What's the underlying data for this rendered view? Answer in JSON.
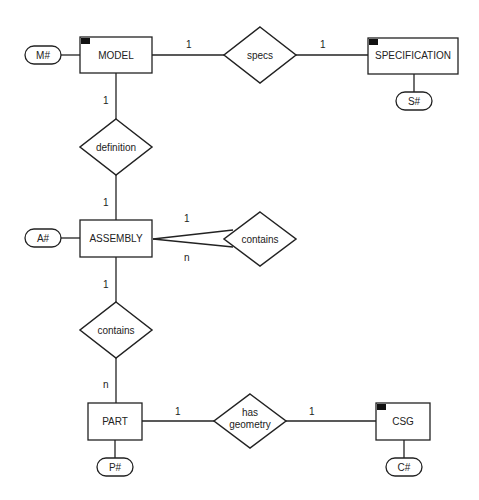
{
  "diagram": {
    "type": "entity-relationship",
    "entities": [
      {
        "id": "model",
        "label": "MODEL",
        "key": "M#",
        "marked": true
      },
      {
        "id": "specification",
        "label": "SPECIFICATION",
        "key": "S#",
        "marked": true
      },
      {
        "id": "assembly",
        "label": "ASSEMBLY",
        "key": "A#",
        "marked": false
      },
      {
        "id": "part",
        "label": "PART",
        "key": "P#",
        "marked": false
      },
      {
        "id": "csg",
        "label": "CSG",
        "key": "C#",
        "marked": true
      }
    ],
    "relationships": [
      {
        "id": "specs",
        "label": "specs",
        "from": "MODEL",
        "to": "SPECIFICATION",
        "card_from": "1",
        "card_to": "1"
      },
      {
        "id": "definition",
        "label": "definition",
        "from": "MODEL",
        "to": "ASSEMBLY",
        "card_from": "1",
        "card_to": "1"
      },
      {
        "id": "contains_self",
        "label": "contains",
        "from": "ASSEMBLY",
        "to": "ASSEMBLY",
        "card_from": "1",
        "card_to": "n"
      },
      {
        "id": "contains_part",
        "label": "contains",
        "from": "ASSEMBLY",
        "to": "PART",
        "card_from": "1",
        "card_to": "n"
      },
      {
        "id": "has_geometry",
        "label_line1": "has",
        "label_line2": "geometry",
        "from": "PART",
        "to": "CSG",
        "card_from": "1",
        "card_to": "1"
      }
    ]
  },
  "colors": {
    "stroke": "#222222",
    "marker": "#111111",
    "background": "#ffffff"
  }
}
